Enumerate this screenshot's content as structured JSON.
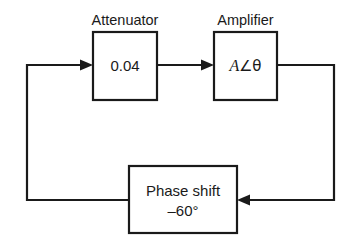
{
  "diagram": {
    "type": "block-diagram",
    "background_color": "#ffffff",
    "line_color": "#1a1a1a",
    "blocks": [
      {
        "id": "attenuator",
        "label": "Attenuator",
        "value": "0.04",
        "x": 93,
        "y": 32,
        "w": 64,
        "h": 68
      },
      {
        "id": "amplifier",
        "label": "Amplifier",
        "value_parts": {
          "gain": "A",
          "angle_symbol": "∠",
          "phase_symbol": "θ"
        },
        "value": "A∠θ",
        "x": 214,
        "y": 32,
        "w": 63,
        "h": 68
      },
      {
        "id": "phase-shift",
        "label": "",
        "value_line1": "Phase shift",
        "value_line2": "–60°",
        "x": 129,
        "y": 166,
        "w": 108,
        "h": 67
      }
    ],
    "connections": [
      {
        "id": "input-to-attenuator",
        "from": "loop-left",
        "to": "attenuator",
        "arrow": "right"
      },
      {
        "id": "attenuator-to-amplifier",
        "from": "attenuator",
        "to": "amplifier",
        "arrow": "right"
      },
      {
        "id": "amplifier-to-phase-shift",
        "from": "amplifier",
        "to": "phase-shift",
        "arrow": "left"
      },
      {
        "id": "phase-shift-to-loop-left",
        "from": "phase-shift",
        "to": "loop-left",
        "arrow": "none"
      }
    ]
  }
}
